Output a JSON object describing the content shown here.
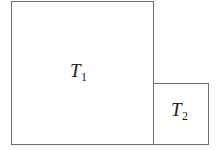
{
  "figure": {
    "canvas": {
      "width": 219,
      "height": 150,
      "background_color": "#ffffff"
    },
    "stroke_color": "#6e6e6e",
    "text_color": "#1b1b1b",
    "shapes": [
      {
        "id": "t1",
        "kind": "square",
        "label_base": "T",
        "label_subscript": "1",
        "label_full": "T1",
        "x": 11,
        "y": 1,
        "width": 143,
        "height": 144
      },
      {
        "id": "t2",
        "kind": "square",
        "label_base": "T",
        "label_subscript": "2",
        "label_full": "T2",
        "x": 153,
        "y": 83,
        "width": 55,
        "height": 61
      }
    ]
  },
  "chart_data": {
    "type": "diagram",
    "title": "",
    "units": "pixels",
    "elements": [
      {
        "name": "T1",
        "shape": "square",
        "left": 11,
        "top": 1,
        "right": 154,
        "bottom": 145,
        "width": 143,
        "height": 144
      },
      {
        "name": "T2",
        "shape": "square",
        "left": 153,
        "top": 83,
        "right": 208,
        "bottom": 144,
        "width": 55,
        "height": 61
      }
    ],
    "relations": [
      "T2.left edge coincides with T1.right edge",
      "T1.bottom and T2.bottom are aligned",
      "T2 is smaller than T1"
    ],
    "grid": false,
    "legend": null,
    "xlabel": "",
    "ylabel": ""
  }
}
